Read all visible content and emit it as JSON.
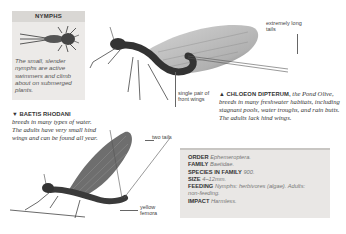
{
  "nymphs_box": {
    "title": "NYMPHS",
    "text": "The small, slender nymphs are active swimmers and climb about on submerged plants."
  },
  "labels": {
    "extremely_long_tails": "extremely long tails",
    "single_pair_front_wings": "single pair of front wings",
    "two_tails": "two tails",
    "yellow_femora": "yellow femora"
  },
  "captions": {
    "chloeon": {
      "marker": "▲",
      "name": "CHLOEON DIPTERUM,",
      "text": "the Pond Olive, breeds in many freshwater habitats, including stagnant pools, water troughs, and rain butts. The adults lack hind wings."
    },
    "baetis": {
      "marker": "▼",
      "name": "BAETIS RHODANI",
      "text": "breeds in many types of water. The adults have very small hind wings and can be found all year."
    }
  },
  "info_box": {
    "rows": [
      {
        "key": "ORDER",
        "value": "Ephemeroptera."
      },
      {
        "key": "FAMILY",
        "value": "Baetidae."
      },
      {
        "key": "SPECIES IN FAMILY",
        "value": "900."
      },
      {
        "key": "SIZE",
        "value": "4–12mm."
      },
      {
        "key": "FEEDING",
        "value": "Nymphs: herbivores (algae). Adults: non-feeding."
      },
      {
        "key": "IMPACT",
        "value": "Harmless."
      }
    ]
  },
  "colors": {
    "box_bg": "#eceae8",
    "box_header": "#d9d7d4",
    "info_bg": "#e9e7e5"
  }
}
